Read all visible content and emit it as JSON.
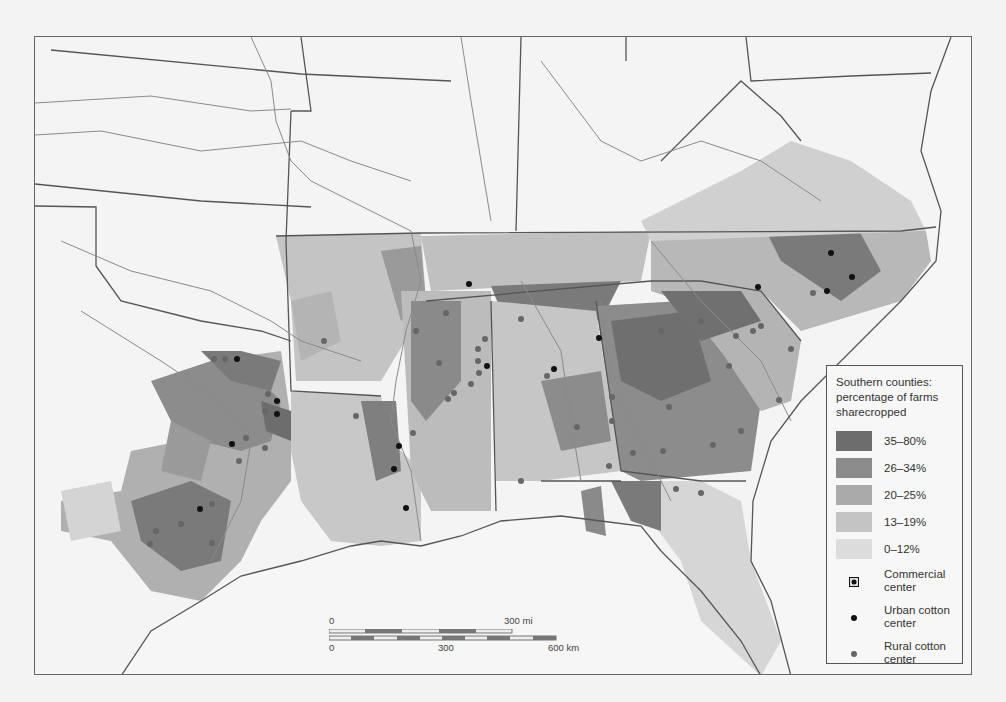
{
  "legend": {
    "title": "Southern counties: percentage of farms sharecropped",
    "classes": [
      {
        "label": "35–80%",
        "color": "#6d6d6d"
      },
      {
        "label": "26–34%",
        "color": "#8c8c8c"
      },
      {
        "label": "20–25%",
        "color": "#aaaaaa"
      },
      {
        "label": "13–19%",
        "color": "#c4c4c4"
      },
      {
        "label": "0–12%",
        "color": "#dcdcdc"
      }
    ],
    "symbols": [
      {
        "label": "Commercial center",
        "icon": "commercial-center-icon"
      },
      {
        "label": "Urban cotton center",
        "icon": "urban-cotton-center-icon"
      },
      {
        "label": "Rural cotton center",
        "icon": "rural-cotton-center-icon"
      }
    ]
  },
  "scale": {
    "mi_zero": "0",
    "mi_end": "300 mi",
    "km_zero": "0",
    "km_mid": "300",
    "km_end": "600 km"
  },
  "colors": {
    "background": "#f4f4f4",
    "border": "#666666",
    "river": "#8a8a8a",
    "state_line": "#555555",
    "urban_dot": "#111111",
    "rural_dot": "#666666"
  }
}
